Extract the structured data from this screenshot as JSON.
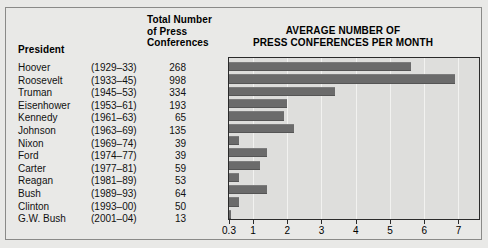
{
  "table": {
    "headers": {
      "president": "President",
      "total_line1": "Total Number",
      "total_line2": "of Press",
      "total_line3": "Conferences"
    },
    "rows": [
      {
        "name": "Hoover",
        "years": "(1929–33)",
        "count": "268"
      },
      {
        "name": "Roosevelt",
        "years": "(1933–45)",
        "count": "998"
      },
      {
        "name": "Truman",
        "years": "(1945–53)",
        "count": "334"
      },
      {
        "name": "Eisenhower",
        "years": "(1953–61)",
        "count": "193"
      },
      {
        "name": "Kennedy",
        "years": "(1961–63)",
        "count": "65"
      },
      {
        "name": "Johnson",
        "years": "(1963–69)",
        "count": "135"
      },
      {
        "name": "Nixon",
        "years": "(1969–74)",
        "count": "39"
      },
      {
        "name": "Ford",
        "years": "(1974–77)",
        "count": "39"
      },
      {
        "name": "Carter",
        "years": "(1977–81)",
        "count": "59"
      },
      {
        "name": "Reagan",
        "years": "(1981–89)",
        "count": "53"
      },
      {
        "name": "Bush",
        "years": "(1989–93)",
        "count": "64"
      },
      {
        "name": "Clinton",
        "years": "(1993–00)",
        "count": "50"
      },
      {
        "name": "G.W. Bush",
        "years": "(2001–04)",
        "count": "13"
      }
    ]
  },
  "chart_title": {
    "line1": "AVERAGE NUMBER OF",
    "line2": "PRESS CONFERENCES PER MONTH"
  },
  "colors": {
    "bar": "#6b6b6b",
    "plot_background": "#dededc",
    "page_background": "#e9e9e7",
    "gridline": "#f2f2f0",
    "axis": "#2a2a2a"
  },
  "chart_data": {
    "type": "bar",
    "orientation": "horizontal",
    "title": "AVERAGE NUMBER OF PRESS CONFERENCES PER MONTH",
    "xlabel": "",
    "ylabel": "",
    "categories": [
      "Hoover",
      "Roosevelt",
      "Truman",
      "Eisenhower",
      "Kennedy",
      "Johnson",
      "Nixon",
      "Ford",
      "Carter",
      "Reagan",
      "Bush",
      "Clinton",
      "G.W. Bush"
    ],
    "values": [
      5.6,
      6.9,
      3.4,
      2.0,
      1.9,
      2.2,
      0.6,
      1.4,
      1.2,
      0.6,
      1.4,
      0.6,
      0.1
    ],
    "xlim": [
      0.3,
      7.6
    ],
    "tick_values": [
      0.3,
      1,
      2,
      3,
      4,
      5,
      6,
      7
    ],
    "tick_labels": [
      "0.3",
      "1",
      "2",
      "3",
      "4",
      "5",
      "6",
      "7"
    ],
    "grid": true,
    "legend": "none"
  }
}
